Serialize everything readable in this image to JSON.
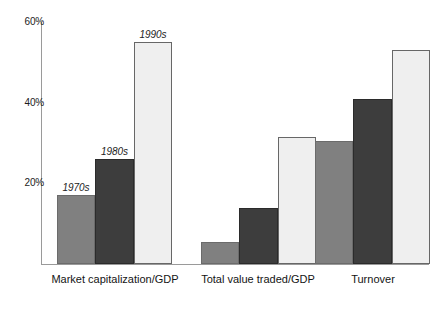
{
  "chart_data": {
    "type": "bar",
    "title": "",
    "subtitle": "",
    "xlabel": "",
    "ylabel": "",
    "ylim": [
      0,
      60
    ],
    "yunit": "%",
    "grid": false,
    "legend_position": "none",
    "annotations_style": "italic decade labels above first group bars",
    "ytick_labels": [
      "20%",
      "40%",
      "60%"
    ],
    "ytick_values": [
      20,
      40,
      60
    ],
    "categories": [
      "Market capitalization/GDP",
      "Total value traded/GDP",
      "Turnover"
    ],
    "series": [
      {
        "name": "1970s",
        "color": "#808080",
        "values": [
          17,
          5.5,
          30.5
        ]
      },
      {
        "name": "1980s",
        "color": "#3d3d3d",
        "values": [
          26,
          14,
          41
        ]
      },
      {
        "name": "1990s",
        "color": "#efefef",
        "values": [
          55,
          31.5,
          53
        ]
      }
    ],
    "bar_annotations": [
      {
        "group": 0,
        "series": 0,
        "text": "1970s"
      },
      {
        "group": 0,
        "series": 1,
        "text": "1980s"
      },
      {
        "group": 0,
        "series": 2,
        "text": "1990s"
      }
    ],
    "axis_color": "#9a9a9a",
    "background": "#ffffff"
  }
}
